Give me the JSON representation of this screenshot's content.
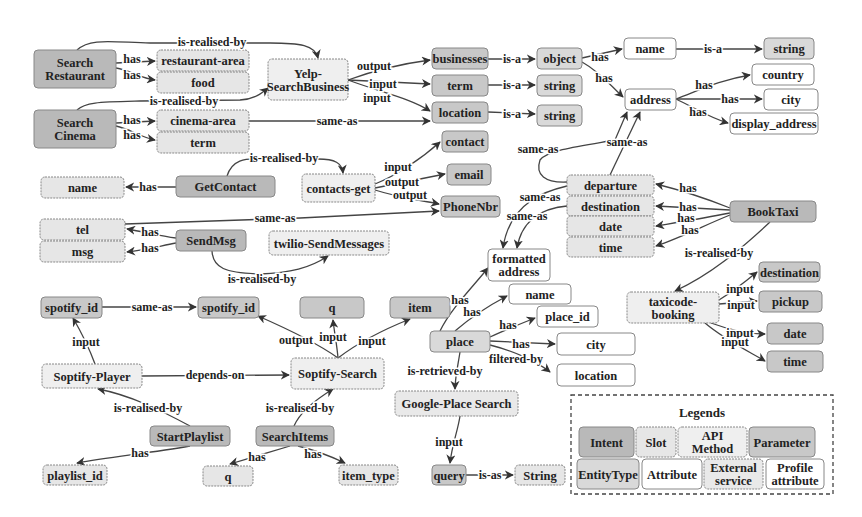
{
  "diagram": {
    "colors": {
      "intent": "#b9b9b9",
      "slot": "#e6e6e6",
      "api_method": "#efefef",
      "parameter": "#c8c8c8",
      "entity_type": "#d9d9d9",
      "attribute": "#ffffff",
      "external_service": "#e9e9e9",
      "profile_attribute": "#ffffff",
      "stroke": "#888888",
      "edge": "#444444"
    },
    "nodes": [
      {
        "id": "search_restaurant",
        "label": "Search\nRestaurant",
        "type": "intent",
        "x": 34,
        "y": 50,
        "w": 82,
        "h": 38
      },
      {
        "id": "restaurant_area",
        "label": "restaurant-area",
        "type": "slot",
        "x": 157,
        "y": 50,
        "w": 92,
        "h": 21
      },
      {
        "id": "food",
        "label": "food",
        "type": "slot",
        "x": 157,
        "y": 72,
        "w": 92,
        "h": 21
      },
      {
        "id": "yelp",
        "label": "Yelp-\nSearchBusiness",
        "type": "api_method",
        "x": 268,
        "y": 59,
        "w": 80,
        "h": 41
      },
      {
        "id": "search_cinema",
        "label": "Search\nCinema",
        "type": "intent",
        "x": 34,
        "y": 110,
        "w": 82,
        "h": 38
      },
      {
        "id": "cinema_area",
        "label": "cinema-area",
        "type": "slot",
        "x": 157,
        "y": 110,
        "w": 92,
        "h": 21
      },
      {
        "id": "term_slot",
        "label": "term",
        "type": "slot",
        "x": 157,
        "y": 132,
        "w": 92,
        "h": 21
      },
      {
        "id": "businesses",
        "label": "businesses",
        "type": "parameter",
        "x": 432,
        "y": 48,
        "w": 56,
        "h": 21
      },
      {
        "id": "term_param",
        "label": "term",
        "type": "parameter",
        "x": 432,
        "y": 75,
        "w": 56,
        "h": 21
      },
      {
        "id": "location_param",
        "label": "location",
        "type": "parameter",
        "x": 432,
        "y": 102,
        "w": 56,
        "h": 21
      },
      {
        "id": "object",
        "label": "object",
        "type": "entity_type",
        "x": 537,
        "y": 48,
        "w": 45,
        "h": 21
      },
      {
        "id": "string1",
        "label": "string",
        "type": "entity_type",
        "x": 537,
        "y": 75,
        "w": 45,
        "h": 21
      },
      {
        "id": "string2",
        "label": "string",
        "type": "entity_type",
        "x": 537,
        "y": 105,
        "w": 45,
        "h": 21
      },
      {
        "id": "name_attr",
        "label": "name",
        "type": "attribute",
        "x": 624,
        "y": 38,
        "w": 52,
        "h": 21
      },
      {
        "id": "string3",
        "label": "string",
        "type": "entity_type",
        "x": 764,
        "y": 38,
        "w": 50,
        "h": 21
      },
      {
        "id": "address",
        "label": "address",
        "type": "attribute",
        "x": 625,
        "y": 89,
        "w": 51,
        "h": 21
      },
      {
        "id": "country",
        "label": "country",
        "type": "attribute",
        "x": 752,
        "y": 64,
        "w": 62,
        "h": 21
      },
      {
        "id": "city1",
        "label": "city",
        "type": "attribute",
        "x": 764,
        "y": 89,
        "w": 54,
        "h": 21
      },
      {
        "id": "display_address",
        "label": "display_address",
        "type": "attribute",
        "x": 730,
        "y": 113,
        "w": 88,
        "h": 21
      },
      {
        "id": "contact",
        "label": "contact",
        "type": "parameter",
        "x": 442,
        "y": 131,
        "w": 46,
        "h": 21
      },
      {
        "id": "email",
        "label": "email",
        "type": "parameter",
        "x": 447,
        "y": 164,
        "w": 44,
        "h": 21
      },
      {
        "id": "phonenbr",
        "label": "PhoneNbr",
        "type": "parameter",
        "x": 441,
        "y": 196,
        "w": 59,
        "h": 21
      },
      {
        "id": "getcontact",
        "label": "GetContact",
        "type": "intent",
        "x": 176,
        "y": 176,
        "w": 99,
        "h": 21
      },
      {
        "id": "contacts_get",
        "label": "contacts-get",
        "type": "api_method",
        "x": 302,
        "y": 174,
        "w": 73,
        "h": 28
      },
      {
        "id": "name_slot",
        "label": "name",
        "type": "slot",
        "x": 41,
        "y": 177,
        "w": 83,
        "h": 21
      },
      {
        "id": "tel",
        "label": "tel",
        "type": "slot",
        "x": 40,
        "y": 219,
        "w": 85,
        "h": 21
      },
      {
        "id": "msg",
        "label": "msg",
        "type": "slot",
        "x": 40,
        "y": 241,
        "w": 85,
        "h": 21
      },
      {
        "id": "sendmsg",
        "label": "SendMsg",
        "type": "intent",
        "x": 176,
        "y": 230,
        "w": 70,
        "h": 21
      },
      {
        "id": "twilio",
        "label": "twilio-SendMessages",
        "type": "api_method",
        "x": 269,
        "y": 231,
        "w": 120,
        "h": 24
      },
      {
        "id": "departure",
        "label": "departure",
        "type": "slot",
        "x": 567,
        "y": 175,
        "w": 87,
        "h": 20
      },
      {
        "id": "destination_slot",
        "label": "destination",
        "type": "slot",
        "x": 567,
        "y": 196,
        "w": 87,
        "h": 20
      },
      {
        "id": "date_slot",
        "label": "date",
        "type": "slot",
        "x": 567,
        "y": 216,
        "w": 87,
        "h": 20
      },
      {
        "id": "time_slot",
        "label": "time",
        "type": "slot",
        "x": 567,
        "y": 237,
        "w": 87,
        "h": 20
      },
      {
        "id": "booktaxi",
        "label": "BookTaxi",
        "type": "intent",
        "x": 730,
        "y": 201,
        "w": 86,
        "h": 21
      },
      {
        "id": "formatted_address",
        "label": "formatted\naddress",
        "type": "attribute",
        "x": 488,
        "y": 249,
        "w": 62,
        "h": 32
      },
      {
        "id": "name_place",
        "label": "name",
        "type": "attribute",
        "x": 509,
        "y": 284,
        "w": 62,
        "h": 20
      },
      {
        "id": "place_id",
        "label": "place_id",
        "type": "attribute",
        "x": 537,
        "y": 306,
        "w": 61,
        "h": 21
      },
      {
        "id": "city2",
        "label": "city",
        "type": "attribute",
        "x": 557,
        "y": 333,
        "w": 78,
        "h": 22
      },
      {
        "id": "location_attr",
        "label": "location",
        "type": "attribute",
        "x": 557,
        "y": 364,
        "w": 78,
        "h": 22
      },
      {
        "id": "destination_param",
        "label": "destination",
        "type": "parameter",
        "x": 759,
        "y": 262,
        "w": 61,
        "h": 20
      },
      {
        "id": "taxicode",
        "label": "taxicode-\nbooking",
        "type": "api_method",
        "x": 627,
        "y": 292,
        "w": 92,
        "h": 31
      },
      {
        "id": "pickup",
        "label": "pickup",
        "type": "parameter",
        "x": 759,
        "y": 291,
        "w": 63,
        "h": 21
      },
      {
        "id": "date_param",
        "label": "date",
        "type": "parameter",
        "x": 767,
        "y": 323,
        "w": 56,
        "h": 21
      },
      {
        "id": "time_param",
        "label": "time",
        "type": "parameter",
        "x": 767,
        "y": 351,
        "w": 56,
        "h": 21
      },
      {
        "id": "spotify_id1",
        "label": "spotify_id",
        "type": "parameter",
        "x": 41,
        "y": 297,
        "w": 61,
        "h": 21
      },
      {
        "id": "spotify_id2",
        "label": "spotify_id",
        "type": "parameter",
        "x": 198,
        "y": 297,
        "w": 61,
        "h": 21
      },
      {
        "id": "q_param",
        "label": "q",
        "type": "parameter",
        "x": 300,
        "y": 297,
        "w": 64,
        "h": 21
      },
      {
        "id": "item",
        "label": "item",
        "type": "parameter",
        "x": 390,
        "y": 297,
        "w": 60,
        "h": 21
      },
      {
        "id": "place",
        "label": "place",
        "type": "entity_type",
        "x": 430,
        "y": 331,
        "w": 60,
        "h": 21
      },
      {
        "id": "soptify_player",
        "label": "Soptify-Player",
        "type": "api_method",
        "x": 42,
        "y": 364,
        "w": 100,
        "h": 24
      },
      {
        "id": "soptify_search",
        "label": "Soptify-Search",
        "type": "api_method",
        "x": 291,
        "y": 358,
        "w": 93,
        "h": 31
      },
      {
        "id": "google_place",
        "label": "Google-Place Search",
        "type": "external_service",
        "x": 395,
        "y": 391,
        "w": 123,
        "h": 25
      },
      {
        "id": "startplaylist",
        "label": "StartPlaylist",
        "type": "intent",
        "x": 150,
        "y": 426,
        "w": 80,
        "h": 20
      },
      {
        "id": "searchitems",
        "label": "SearchItems",
        "type": "intent",
        "x": 256,
        "y": 426,
        "w": 78,
        "h": 20
      },
      {
        "id": "playlist_id",
        "label": "playlist_id",
        "type": "slot",
        "x": 43,
        "y": 465,
        "w": 64,
        "h": 20
      },
      {
        "id": "q_slot",
        "label": "q",
        "type": "slot",
        "x": 203,
        "y": 466,
        "w": 50,
        "h": 20
      },
      {
        "id": "item_type",
        "label": "item_type",
        "type": "slot",
        "x": 339,
        "y": 465,
        "w": 59,
        "h": 20
      },
      {
        "id": "query",
        "label": "query",
        "type": "parameter",
        "x": 432,
        "y": 465,
        "w": 34,
        "h": 20
      },
      {
        "id": "string4",
        "label": "String",
        "type": "slot",
        "x": 515,
        "y": 465,
        "w": 50,
        "h": 20
      }
    ],
    "edges": [
      {
        "label": "is-realised-by",
        "d": "M77 50 C90 38 110 42 150 43 L270 43 C300 43 315 45 318 58",
        "lx": 212,
        "ly": 46
      },
      {
        "label": "has",
        "d": "M116 63 L155 61",
        "lx": 132,
        "ly": 63
      },
      {
        "label": "has",
        "d": "M116 68 C130 70 140 78 155 80",
        "lx": 132,
        "ly": 79
      },
      {
        "label": "is-realised-by",
        "d": "M77 110 C85 102 100 102 140 101 L240 100 C255 99 262 93 268 88",
        "lx": 184,
        "ly": 105
      },
      {
        "label": "has",
        "d": "M116 123 L155 121",
        "lx": 132,
        "ly": 124
      },
      {
        "label": "has",
        "d": "M116 126 C130 129 140 137 155 140",
        "lx": 132,
        "ly": 139
      },
      {
        "label": "same-as",
        "d": "M249 121 L430 121",
        "lx": 337,
        "ly": 125
      },
      {
        "label": "output",
        "d": "M348 80 C370 72 400 64 430 60",
        "lx": 374,
        "ly": 70
      },
      {
        "label": "input",
        "d": "M348 80 L430 84",
        "lx": 383,
        "ly": 88
      },
      {
        "label": "input",
        "d": "M348 80 C380 92 410 98 430 111",
        "lx": 377,
        "ly": 102
      },
      {
        "label": "is-a",
        "d": "M488 59 L535 59",
        "lx": 512,
        "ly": 63
      },
      {
        "label": "is-a",
        "d": "M488 85 L535 85",
        "lx": 512,
        "ly": 89
      },
      {
        "label": "is-a",
        "d": "M488 112 L535 114",
        "lx": 512,
        "ly": 118
      },
      {
        "label": "has",
        "d": "M582 58 L622 49",
        "lx": 600,
        "ly": 61
      },
      {
        "label": "has",
        "d": "M582 62 C600 72 610 85 623 97",
        "lx": 604,
        "ly": 82
      },
      {
        "label": "is-a",
        "d": "M676 49 L762 49",
        "lx": 713,
        "ly": 53
      },
      {
        "label": "has",
        "d": "M676 99 C700 90 720 80 750 75",
        "lx": 704,
        "ly": 89
      },
      {
        "label": "has",
        "d": "M676 99 L762 99",
        "lx": 730,
        "ly": 103
      },
      {
        "label": "has",
        "d": "M676 99 C695 108 710 118 728 123",
        "lx": 698,
        "ly": 116
      },
      {
        "label": "is-realised-by",
        "d": "M227 176 C232 160 245 158 260 159 L318 159 C335 159 342 163 343 173",
        "lx": 284,
        "ly": 162
      },
      {
        "label": "has",
        "d": "M176 187 L126 187",
        "lx": 148,
        "ly": 191
      },
      {
        "label": "input",
        "d": "M375 184 C395 176 420 160 440 142",
        "lx": 398,
        "ly": 171
      },
      {
        "label": "output",
        "d": "M375 188 L445 174",
        "lx": 402,
        "ly": 186
      },
      {
        "label": "output",
        "d": "M375 190 C400 198 420 200 439 204",
        "lx": 410,
        "ly": 199
      },
      {
        "label": "same-as",
        "d": "M125 224 L300 218 L439 211",
        "lx": 275,
        "ly": 222
      },
      {
        "label": "has",
        "d": "M176 238 C160 236 145 232 127 229",
        "lx": 150,
        "ly": 236
      },
      {
        "label": "has",
        "d": "M176 243 C160 246 145 250 127 252",
        "lx": 150,
        "ly": 252
      },
      {
        "label": "is-realised-by",
        "d": "M212 251 C213 268 225 273 260 274 C290 273 310 268 328 256",
        "lx": 262,
        "ly": 283
      },
      {
        "label": "same-as",
        "d": "M567 182 C545 183 535 175 540 160 C548 150 580 146 615 140 L627 112",
        "lx": 538,
        "ly": 153
      },
      {
        "label": "same-as",
        "d": "M610 175 L640 112",
        "lx": 627,
        "ly": 146
      },
      {
        "label": "same-as",
        "d": "M567 186 C550 190 510 200 503 248",
        "lx": 540,
        "ly": 201
      },
      {
        "label": "same-as",
        "d": "M567 206 C545 208 522 218 517 248",
        "lx": 527,
        "ly": 220
      },
      {
        "label": "has",
        "d": "M730 208 C705 198 680 190 656 184",
        "lx": 688,
        "ly": 192
      },
      {
        "label": "has",
        "d": "M730 210 L656 206",
        "lx": 688,
        "ly": 211
      },
      {
        "label": "has",
        "d": "M730 213 C705 218 680 222 656 226",
        "lx": 686,
        "ly": 222
      },
      {
        "label": "has",
        "d": "M730 215 C705 225 680 238 656 246",
        "lx": 690,
        "ly": 234
      },
      {
        "label": "is-realised-by",
        "d": "M770 222 C740 250 710 275 675 291",
        "lx": 719,
        "ly": 257
      },
      {
        "label": "input",
        "d": "M719 300 C735 290 745 282 757 272",
        "lx": 740,
        "ly": 293
      },
      {
        "label": "input",
        "d": "M719 304 L757 301",
        "lx": 741,
        "ly": 309
      },
      {
        "label": "input",
        "d": "M711 323 C730 330 750 334 765 334",
        "lx": 740,
        "ly": 337
      },
      {
        "label": "input",
        "d": "M705 323 C725 340 750 352 765 361",
        "lx": 735,
        "ly": 346
      },
      {
        "label": "has",
        "d": "M440 331 C450 310 470 290 488 268",
        "lx": 460,
        "ly": 304
      },
      {
        "label": "has",
        "d": "M455 331 C470 318 490 305 507 296",
        "lx": 472,
        "ly": 316
      },
      {
        "label": "has",
        "d": "M490 337 C505 330 520 324 535 318",
        "lx": 508,
        "ly": 329
      },
      {
        "label": "has",
        "d": "M490 341 L555 344",
        "lx": 521,
        "ly": 348
      },
      {
        "label": "filtered-by",
        "d": "M490 345 C510 350 535 360 550 372",
        "lx": 516,
        "ly": 363
      },
      {
        "label": "is-retrieved-by",
        "d": "M460 352 C458 365 455 378 455 389",
        "lx": 445,
        "ly": 375
      },
      {
        "label": "input",
        "d": "M460 416 C458 430 452 445 450 463",
        "lx": 449,
        "ly": 446
      },
      {
        "label": "is-as",
        "d": "M466 475 L513 475",
        "lx": 490,
        "ly": 479
      },
      {
        "label": "same-as",
        "d": "M102 307 L196 307",
        "lx": 152,
        "ly": 311
      },
      {
        "label": "input",
        "d": "M95 364 C88 345 80 330 73 318",
        "lx": 86,
        "ly": 346
      },
      {
        "label": "depends-on",
        "d": "M142 376 L289 375",
        "lx": 215,
        "ly": 379
      },
      {
        "label": "output",
        "d": "M338 358 C320 345 290 330 258 316",
        "lx": 296,
        "ly": 344
      },
      {
        "label": "input",
        "d": "M338 358 C337 345 334 330 333 320",
        "lx": 333,
        "ly": 341
      },
      {
        "label": "input",
        "d": "M338 358 C355 345 375 333 410 319",
        "lx": 372,
        "ly": 345
      },
      {
        "label": "is-realised-by",
        "d": "M190 426 C160 410 130 395 98 389",
        "lx": 148,
        "ly": 412
      },
      {
        "label": "is-realised-by",
        "d": "M294 426 C300 412 315 400 333 389",
        "lx": 300,
        "ly": 412
      },
      {
        "label": "has",
        "d": "M190 446 C150 453 110 457 77 463",
        "lx": 140,
        "ly": 457
      },
      {
        "label": "has",
        "d": "M290 446 C270 452 250 458 230 464",
        "lx": 257,
        "ly": 461
      },
      {
        "label": "has",
        "d": "M298 446 C315 450 330 456 345 463",
        "lx": 313,
        "ly": 458
      }
    ],
    "legend": {
      "title": "Legends",
      "box": {
        "x": 571,
        "y": 395,
        "w": 262,
        "h": 99
      },
      "items": [
        {
          "label": "Intent",
          "type": "intent",
          "x": 579,
          "y": 427,
          "w": 55,
          "h": 30
        },
        {
          "label": "Slot",
          "type": "slot",
          "x": 636,
          "y": 427,
          "w": 40,
          "h": 30
        },
        {
          "label": "API\nMethod",
          "type": "api_method",
          "x": 678,
          "y": 427,
          "w": 69,
          "h": 30
        },
        {
          "label": "Parameter",
          "type": "parameter",
          "x": 749,
          "y": 427,
          "w": 66,
          "h": 30
        },
        {
          "label": "EntityType",
          "type": "entity_type",
          "x": 577,
          "y": 459,
          "w": 62,
          "h": 30
        },
        {
          "label": "Attribute",
          "type": "attribute",
          "x": 642,
          "y": 459,
          "w": 60,
          "h": 30
        },
        {
          "label": "External\nservice",
          "type": "external_service",
          "x": 704,
          "y": 459,
          "w": 59,
          "h": 30
        },
        {
          "label": "Profile\nattribute",
          "type": "profile_attribute",
          "x": 766,
          "y": 459,
          "w": 58,
          "h": 30
        }
      ]
    }
  }
}
